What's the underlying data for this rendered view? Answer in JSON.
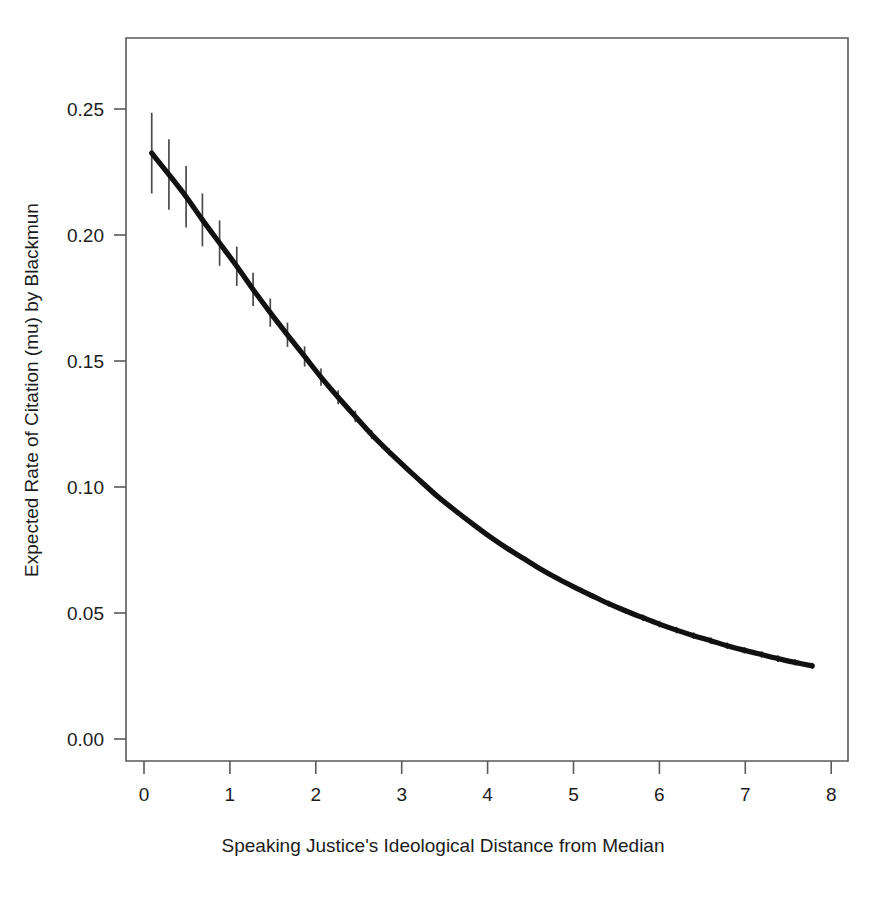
{
  "figure": {
    "title": "",
    "background_color": "#ffffff",
    "curve_color": "#111111",
    "errorbar_color": "#4a4a4a",
    "axis_color": "#5a5a5a"
  },
  "chart_data": {
    "type": "line",
    "title": "",
    "subtitle": "",
    "xlabel": "Speaking Justice's Ideological Distance from Median",
    "ylabel": "Expected Rate of Citation (mu) by Blackmun",
    "xlim": [
      -0.35,
      8.25
    ],
    "ylim": [
      -0.012,
      0.2755
    ],
    "xticks": [
      0,
      1,
      2,
      3,
      4,
      5,
      6,
      7,
      8
    ],
    "xticklabels": [
      "0",
      "1",
      "2",
      "3",
      "4",
      "5",
      "6",
      "7",
      "8"
    ],
    "yticks": [
      0.0,
      0.05,
      0.1,
      0.15,
      0.2,
      0.25
    ],
    "yticklabels": [
      "0.00",
      "0.05",
      "0.10",
      "0.15",
      "0.20",
      "0.25"
    ],
    "grid": false,
    "legend": null,
    "legend_position": "none",
    "annotations": [],
    "series": [
      {
        "name": "Expected rate of citation",
        "style": "line-with-errorbars",
        "x": [
          0.09,
          0.29,
          0.49,
          0.68,
          0.88,
          1.08,
          1.27,
          1.47,
          1.67,
          1.87,
          2.06,
          2.26,
          2.46,
          2.65,
          2.85,
          3.05,
          3.25,
          3.44,
          3.64,
          3.84,
          4.03,
          4.23,
          4.43,
          4.62,
          4.82,
          5.02,
          5.22,
          5.41,
          5.61,
          5.81,
          6.0,
          6.2,
          6.4,
          6.6,
          6.79,
          6.99,
          7.19,
          7.38,
          7.58,
          7.78
        ],
        "y": [
          0.2325,
          0.224,
          0.2152,
          0.206,
          0.1968,
          0.1876,
          0.1784,
          0.1692,
          0.1604,
          0.1518,
          0.1436,
          0.1356,
          0.128,
          0.1208,
          0.114,
          0.1076,
          0.1014,
          0.0956,
          0.0902,
          0.085,
          0.0802,
          0.0756,
          0.0714,
          0.0674,
          0.0636,
          0.0601,
          0.0568,
          0.0537,
          0.0508,
          0.0481,
          0.0456,
          0.0432,
          0.041,
          0.039,
          0.037,
          0.0352,
          0.0335,
          0.0319,
          0.0304,
          0.029
        ],
        "yerr_low": [
          0.2165,
          0.21,
          0.203,
          0.1955,
          0.1878,
          0.1798,
          0.1718,
          0.1636,
          0.1556,
          0.1478,
          0.1402,
          0.1328,
          0.1257,
          0.119,
          0.1126,
          0.1065,
          0.1007,
          0.0952,
          0.09,
          0.0851,
          0.0805,
          0.0761,
          0.072,
          0.0682,
          0.0645,
          0.0611,
          0.0579,
          0.0549,
          0.052,
          0.0494,
          0.0469,
          0.0445,
          0.0423,
          0.0403,
          0.0383,
          0.0365,
          0.0348,
          0.0332,
          0.0316,
          0.0302
        ],
        "yerr_high": [
          0.2485,
          0.238,
          0.2274,
          0.2165,
          0.2058,
          0.1954,
          0.185,
          0.1748,
          0.1652,
          0.1558,
          0.147,
          0.1384,
          0.1303,
          0.1226,
          0.1154,
          0.1087,
          0.1021,
          0.096,
          0.0904,
          0.0849,
          0.0799,
          0.0751,
          0.0708,
          0.0666,
          0.0627,
          0.0591,
          0.0557,
          0.0525,
          0.0496,
          0.0468,
          0.0443,
          0.0419,
          0.0397,
          0.0377,
          0.0357,
          0.0339,
          0.0322,
          0.0306,
          0.0292,
          0.0278
        ]
      }
    ]
  }
}
